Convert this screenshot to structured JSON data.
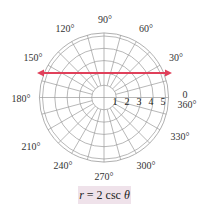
{
  "equation": {
    "r_var": "r",
    "equals": " = 2 csc ",
    "theta": "θ",
    "full": "r = 2 csc θ"
  },
  "angle_labels": [
    {
      "text": "90°",
      "angle": 90
    },
    {
      "text": "120°",
      "angle": 120
    },
    {
      "text": "60°",
      "angle": 60
    },
    {
      "text": "150°",
      "angle": 150
    },
    {
      "text": "30°",
      "angle": 30
    },
    {
      "text": "180°",
      "angle": 180
    },
    {
      "text": "0",
      "angle": 0
    },
    {
      "text": "360°",
      "angle": 360
    },
    {
      "text": "210°",
      "angle": 210
    },
    {
      "text": "330°",
      "angle": 330
    },
    {
      "text": "240°",
      "angle": 240
    },
    {
      "text": "300°",
      "angle": 300
    },
    {
      "text": "270°",
      "angle": 270
    }
  ],
  "radius_labels": [
    "1",
    "2",
    "3",
    "4",
    "5"
  ],
  "grid": {
    "rings": [
      1,
      2,
      3,
      4,
      5
    ],
    "outer_radius_units": 5.25,
    "spoke_step_deg": 15
  },
  "curve": {
    "description": "horizontal line y = 2",
    "y_value": 2,
    "color": "#e0405a",
    "arrows": "both ends"
  },
  "colors": {
    "grid": "#9a9a9a",
    "curve": "#e0405a",
    "caption_bg": "#efe2ea"
  }
}
